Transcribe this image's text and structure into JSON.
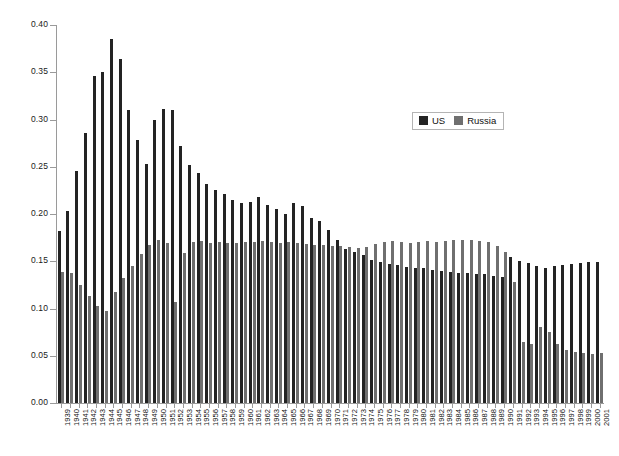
{
  "chart_data": {
    "type": "bar",
    "title": "",
    "subtitle": "",
    "xlabel": "",
    "ylabel": "",
    "ylim": [
      0.0,
      0.4
    ],
    "ytick_labels": [
      "0.00",
      "0.05",
      "0.10",
      "0.15",
      "0.20",
      "0.25",
      "0.30",
      "0.35",
      "0.40"
    ],
    "ytick_values": [
      0.0,
      0.05,
      0.1,
      0.15,
      0.2,
      0.25,
      0.3,
      0.35,
      0.4
    ],
    "grid": false,
    "legend_position": "upper-right-inside",
    "categories": [
      "1939",
      "1940",
      "1941",
      "1942",
      "1943",
      "1944",
      "1945",
      "1946",
      "1947",
      "1948",
      "1949",
      "1950",
      "1951",
      "1952",
      "1953",
      "1954",
      "1955",
      "1956",
      "1957",
      "1958",
      "1959",
      "1960",
      "1961",
      "1962",
      "1963",
      "1964",
      "1965",
      "1966",
      "1967",
      "1968",
      "1969",
      "1970",
      "1971",
      "1972",
      "1973",
      "1974",
      "1975",
      "1976",
      "1977",
      "1978",
      "1979",
      "1980",
      "1981",
      "1982",
      "1983",
      "1984",
      "1985",
      "1986",
      "1987",
      "1988",
      "1989",
      "1990",
      "1991",
      "1992",
      "1993",
      "1994",
      "1995",
      "1996",
      "1997",
      "1998",
      "1999",
      "2000",
      "2001"
    ],
    "series": [
      {
        "name": "US",
        "color": "#232323",
        "values": [
          0.182,
          0.203,
          0.245,
          0.286,
          0.346,
          0.35,
          0.385,
          0.364,
          0.31,
          0.278,
          0.253,
          0.3,
          0.311,
          0.31,
          0.272,
          0.252,
          0.243,
          0.232,
          0.225,
          0.221,
          0.215,
          0.212,
          0.213,
          0.218,
          0.21,
          0.205,
          0.2,
          0.212,
          0.208,
          0.196,
          0.193,
          0.183,
          0.172,
          0.163,
          0.16,
          0.157,
          0.151,
          0.149,
          0.147,
          0.146,
          0.144,
          0.143,
          0.143,
          0.141,
          0.14,
          0.139,
          0.138,
          0.138,
          0.137,
          0.136,
          0.134,
          0.133,
          0.155,
          0.15,
          0.148,
          0.145,
          0.143,
          0.145,
          0.146,
          0.147,
          0.148,
          0.149,
          0.149
        ]
      },
      {
        "name": "Russia",
        "color": "#6f6f6f",
        "values": [
          0.139,
          0.138,
          0.125,
          0.113,
          0.103,
          0.097,
          0.118,
          0.132,
          0.145,
          0.158,
          0.167,
          0.172,
          0.169,
          0.107,
          0.159,
          0.17,
          0.171,
          0.169,
          0.17,
          0.169,
          0.169,
          0.17,
          0.17,
          0.171,
          0.17,
          0.169,
          0.17,
          0.169,
          0.168,
          0.167,
          0.167,
          0.166,
          0.166,
          0.165,
          0.164,
          0.165,
          0.168,
          0.17,
          0.171,
          0.17,
          0.169,
          0.17,
          0.171,
          0.17,
          0.171,
          0.172,
          0.173,
          0.172,
          0.171,
          0.17,
          0.166,
          0.16,
          0.128,
          0.065,
          0.062,
          0.08,
          0.075,
          0.062,
          0.056,
          0.054,
          0.053,
          0.052,
          0.053
        ]
      }
    ]
  },
  "legend": {
    "items": [
      {
        "label": "US",
        "color": "#232323"
      },
      {
        "label": "Russia",
        "color": "#6f6f6f"
      }
    ]
  }
}
